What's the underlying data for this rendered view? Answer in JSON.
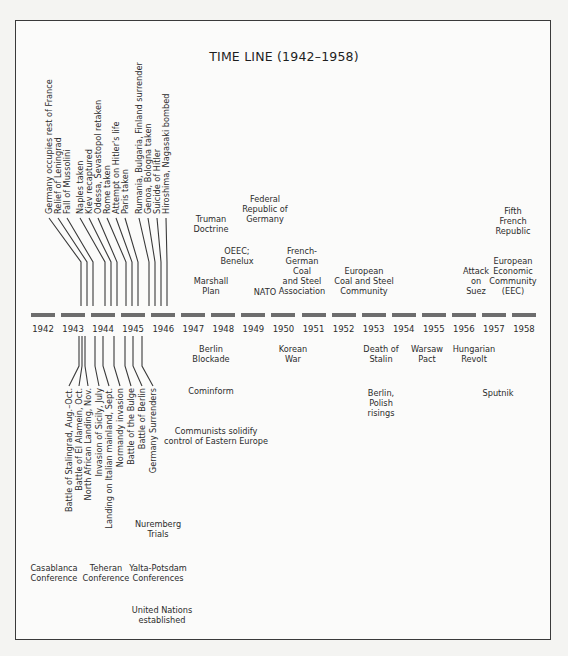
{
  "title": "TIME LINE (1942–1958)",
  "chart_data": {
    "type": "timeline",
    "title": "TIME LINE (1942–1958)",
    "years": [
      "1942",
      "1943",
      "1944",
      "1945",
      "1946",
      "1947",
      "1948",
      "1949",
      "1950",
      "1951",
      "1952",
      "1953",
      "1954",
      "1955",
      "1956",
      "1957",
      "1958"
    ],
    "events_above_vertical": [
      {
        "label": "Germany occupies rest of France",
        "x": 49
      },
      {
        "label": "Relief of Leningrad",
        "x": 58
      },
      {
        "label": "Fall of Mussolini",
        "x": 67
      },
      {
        "label": "Naples taken",
        "x": 80
      },
      {
        "label": "Kiev recaptured",
        "x": 89
      },
      {
        "label": "Odessa, Sevastopol retaken",
        "x": 98
      },
      {
        "label": "Rome taken",
        "x": 107
      },
      {
        "label": "Attempt on Hitler's life",
        "x": 116
      },
      {
        "label": "Paris taken",
        "x": 125
      },
      {
        "label": "Rumania, Bulgaria, Finland surrender",
        "x": 139
      },
      {
        "label": "Genoa, Bologna taken",
        "x": 148
      },
      {
        "label": "Suicide of Hitler",
        "x": 157
      },
      {
        "label": "Hiroshima, Nagasaki bombed",
        "x": 166
      }
    ],
    "events_above": [
      {
        "label": "Truman\nDoctrine",
        "x": 211,
        "y": 214
      },
      {
        "label": "Marshall\nPlan",
        "x": 211,
        "y": 276
      },
      {
        "label": "Federal\nRepublic of\nGermany",
        "x": 265,
        "y": 194
      },
      {
        "label": "OEEC;\nBenelux",
        "x": 237,
        "y": 246
      },
      {
        "label": "NATO",
        "x": 265,
        "y": 287
      },
      {
        "label": "French-\nGerman\nCoal\nand Steel\nAssociation",
        "x": 302,
        "y": 246
      },
      {
        "label": "European\nCoal and Steel\nCommunity",
        "x": 364,
        "y": 266
      },
      {
        "label": "Attack\non\nSuez",
        "x": 476,
        "y": 266
      },
      {
        "label": "Fifth\nFrench\nRepublic",
        "x": 513,
        "y": 206
      },
      {
        "label": "European\nEconomic\nCommunity\n(EEC)",
        "x": 513,
        "y": 256
      }
    ],
    "events_below_vertical": [
      {
        "label": "Battle of Stalingrad, Aug.–Oct.",
        "x": 69
      },
      {
        "label": "Battle of El Alamein, Oct.",
        "x": 79
      },
      {
        "label": "North African Landing, Nov.",
        "x": 88
      },
      {
        "label": "Invasion of Sicily, July",
        "x": 99
      },
      {
        "label": "Landing on Italian mainland, Sept.",
        "x": 109
      },
      {
        "label": "Normandy invasion",
        "x": 120
      },
      {
        "label": "Battle of the Bulge",
        "x": 131
      },
      {
        "label": "Battle of Berlin",
        "x": 142
      },
      {
        "label": "Germany Surrenders",
        "x": 153
      }
    ],
    "events_below": [
      {
        "label": "Berlin\nBlockade",
        "x": 211,
        "y": 344
      },
      {
        "label": "Cominform",
        "x": 211,
        "y": 386
      },
      {
        "label": "Communists solidify\ncontrol of Eastern Europe",
        "x": 216,
        "y": 426
      },
      {
        "label": "Korean\nWar",
        "x": 293,
        "y": 344
      },
      {
        "label": "Death of\nStalin",
        "x": 381,
        "y": 344
      },
      {
        "label": "Warsaw\nPact",
        "x": 427,
        "y": 344
      },
      {
        "label": "Hungarian\nRevolt",
        "x": 474,
        "y": 344
      },
      {
        "label": "Berlin,\nPolish\nrisings",
        "x": 381,
        "y": 388
      },
      {
        "label": "Sputnik",
        "x": 498,
        "y": 388
      },
      {
        "label": "Nuremberg\nTrials",
        "x": 158,
        "y": 519
      },
      {
        "label": "Casablanca\nConference",
        "x": 54,
        "y": 563
      },
      {
        "label": "Teheran\nConference",
        "x": 106,
        "y": 563
      },
      {
        "label": "Yalta-Potsdam\nConferences",
        "x": 158,
        "y": 563
      },
      {
        "label": "United Nations\nestablished",
        "x": 162,
        "y": 605
      }
    ]
  }
}
